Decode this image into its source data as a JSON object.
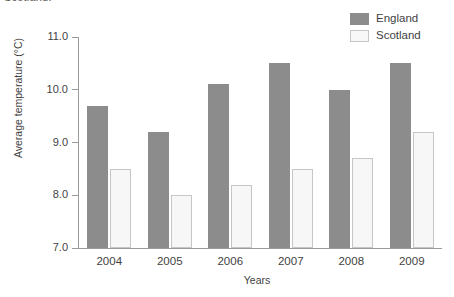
{
  "clipped_caption": "Scotland.",
  "legend": {
    "position": "top-right",
    "entries": [
      {
        "label": "England",
        "color": "#8c8c8c",
        "border": "#8c8c8c"
      },
      {
        "label": "Scotland",
        "color": "#f7f7f7",
        "border": "#c6c6c6"
      }
    ]
  },
  "chart_data": {
    "type": "bar",
    "title": "",
    "xlabel": "Years",
    "ylabel": "Average temperature (°C)",
    "categories": [
      "2004",
      "2005",
      "2006",
      "2007",
      "2008",
      "2009"
    ],
    "series": [
      {
        "name": "England",
        "color": "#8c8c8c",
        "values": [
          9.7,
          9.2,
          10.1,
          10.5,
          10.0,
          10.5
        ]
      },
      {
        "name": "Scotland",
        "color": "#f7f7f7",
        "values": [
          8.5,
          8.0,
          8.2,
          8.5,
          8.7,
          9.2
        ]
      }
    ],
    "ylim": [
      7.0,
      11.0
    ],
    "ytick_step": 1.0,
    "yticks": [
      "7.0",
      "8.0",
      "9.0",
      "10.0",
      "11.0"
    ],
    "grid": false,
    "legend_position": "top-right"
  }
}
